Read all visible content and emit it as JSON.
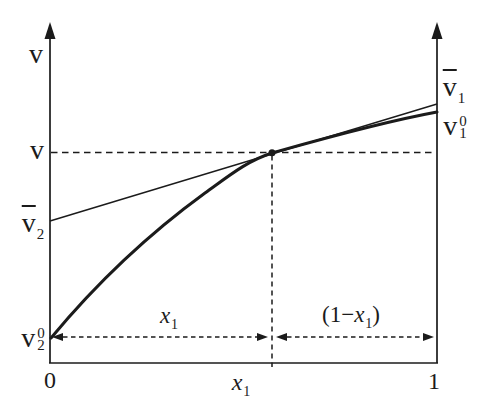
{
  "colors": {
    "ink": "#1b1b1b",
    "background": "#ffffff"
  },
  "labels": {
    "y_axis": "v",
    "v_level": "v",
    "vbar2": {
      "base": "v",
      "sub": "2"
    },
    "v2_0": {
      "base": "v",
      "sup": "0",
      "sub": "2"
    },
    "vbar1": {
      "base": "v",
      "sub": "1"
    },
    "v1_0": {
      "base": "v",
      "sup": "0",
      "sub": "1"
    },
    "origin": "0",
    "x_tick": {
      "base": "x",
      "sub": "1"
    },
    "x_end": "1",
    "span_left": {
      "base": "x",
      "sub": "1"
    },
    "span_right": {
      "prefix": "(1−",
      "base": "x",
      "sub": "1",
      "suffix": ")"
    }
  },
  "chart_data": {
    "type": "line",
    "xlabel": "x1",
    "ylabel": "v",
    "x_range": [
      0,
      1
    ],
    "x_tick_labels": [
      "0",
      "x1",
      "1"
    ],
    "grid": false,
    "marked_x": 0.574,
    "levels_norm": {
      "v2_0": 0.076,
      "vbar2": 0.416,
      "v": 0.617,
      "v1_0": 0.736,
      "vbar1": 0.76
    },
    "series": [
      {
        "name": "molar volume curve v(x1)",
        "style": "thick",
        "x": [
          0,
          0.085,
          0.137,
          0.202,
          0.258,
          0.362,
          0.574,
          0.723,
          0.879,
          1.0
        ],
        "y_norm": [
          0.073,
          0.185,
          0.252,
          0.326,
          0.381,
          0.469,
          0.617,
          0.663,
          0.707,
          0.736
        ]
      },
      {
        "name": "tangent line at x1",
        "style": "thin",
        "x": [
          0,
          1
        ],
        "y_norm": [
          0.416,
          0.76
        ]
      }
    ],
    "annotations": [
      {
        "label": "x1",
        "kind": "double-arrow-span",
        "from_x": 0,
        "to_x": 0.574
      },
      {
        "label": "(1-x1)",
        "kind": "double-arrow-span",
        "from_x": 0.574,
        "to_x": 1
      },
      {
        "label": "v",
        "kind": "dashed-level-line",
        "at_norm": 0.617
      },
      {
        "label": "tangent point",
        "kind": "dot",
        "x": 0.574,
        "y_norm": 0.617
      }
    ],
    "geometry": {
      "ink": "#1b1b1b",
      "x_left": 50,
      "x_right": 437,
      "y_bottom": 363,
      "y_arrow_tip": 22,
      "v_level_y": 152.5,
      "tangent_x": 272,
      "span_y": 337,
      "curve_path": "M 51 338 C 100 279 150 233 205 193 C 230 175 247 161 272 153 C 297 146 377 123 437 112",
      "tangent_line": [
        50,
        221,
        437,
        104
      ],
      "dot": [
        272,
        152.8,
        3.5
      ]
    }
  }
}
